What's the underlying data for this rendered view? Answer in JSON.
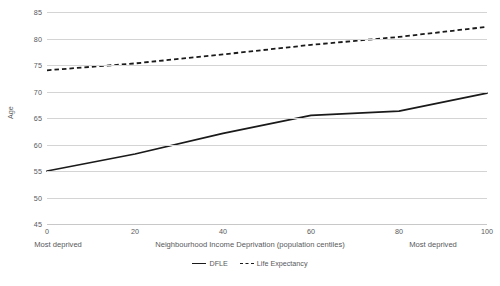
{
  "chart_data": {
    "type": "line",
    "title": "",
    "xlabel": "Neighbourhood Income Deprivation (population centiles)",
    "ylabel": "Age",
    "xlim": [
      0,
      100
    ],
    "ylim": [
      45,
      85
    ],
    "xticks": [
      0,
      20,
      40,
      60,
      80,
      100
    ],
    "yticks": [
      45,
      50,
      55,
      60,
      65,
      70,
      75,
      80,
      85
    ],
    "grid": "horizontal",
    "legend_position": "bottom-center",
    "x": [
      0,
      20,
      40,
      60,
      80,
      100
    ],
    "series": [
      {
        "name": "DFLE",
        "style": "solid",
        "color": "#1a1a1a",
        "values": [
          55.0,
          58.2,
          62.1,
          65.5,
          66.3,
          69.7
        ]
      },
      {
        "name": "Life Expectancy",
        "style": "dashed",
        "color": "#1a1a1a",
        "values": [
          74.0,
          75.3,
          77.0,
          78.8,
          80.3,
          82.2
        ]
      }
    ],
    "annotations": [
      {
        "text": "Most deprived",
        "position": "below-axis-left",
        "at_x": 0
      },
      {
        "text": "Most deprived",
        "position": "below-axis-right",
        "at_x": 100
      }
    ]
  },
  "axis": {
    "y_title": "Age",
    "x_title": "Neighbourhood Income Deprivation (population centiles)",
    "y_tick_labels": [
      "85",
      "80",
      "75",
      "70",
      "65",
      "60",
      "55",
      "50",
      "45"
    ],
    "x_tick_labels": [
      "0",
      "20",
      "40",
      "60",
      "80",
      "100"
    ]
  },
  "notes": {
    "left": "Most deprived",
    "right": "Most deprived"
  },
  "legend": {
    "items": [
      {
        "label": "DFLE",
        "style": "solid"
      },
      {
        "label": "Life Expectancy",
        "style": "dashed"
      }
    ]
  },
  "colors": {
    "line": "#1a1a1a",
    "grid": "#d4d4d4",
    "text": "#58595b",
    "background": "#ffffff"
  }
}
